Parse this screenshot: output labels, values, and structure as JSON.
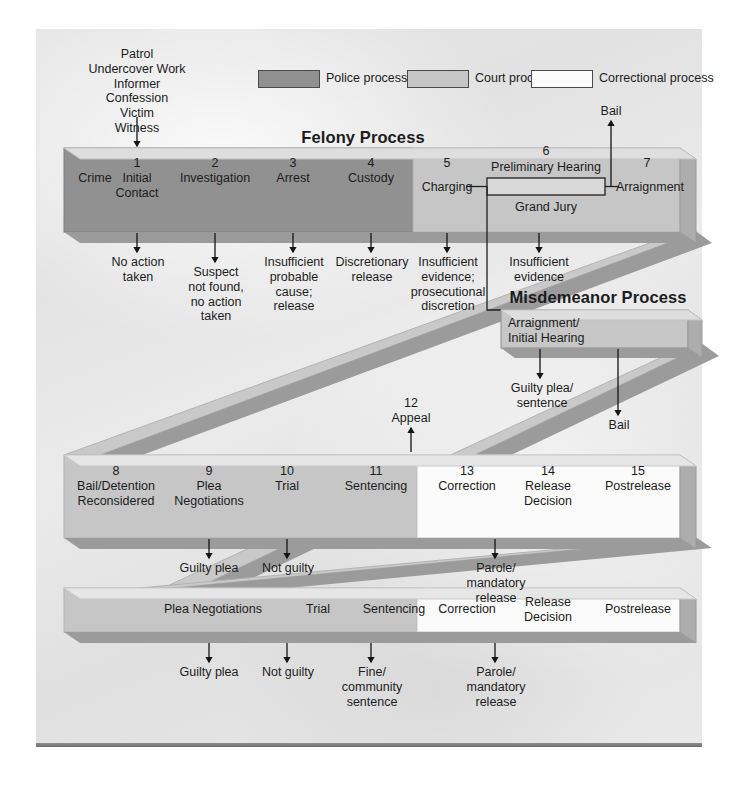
{
  "figure": {
    "title_felony": "Felony Process",
    "title_misdemeanor": "Misdemeanor Process"
  },
  "legend": {
    "items": [
      {
        "label": "Police process",
        "color": "#919191"
      },
      {
        "label": "Court process",
        "color": "#c6c6c6"
      },
      {
        "label": "Correctional process",
        "color": "#fbfbfb"
      }
    ]
  },
  "inputs": {
    "sources": "Patrol\nUndercover Work\nInformer\nConfession\nVictim\nWitness"
  },
  "felony_bar": {
    "steps": [
      {
        "num": "",
        "label": "Crime"
      },
      {
        "num": "1",
        "label": "Initial\nContact"
      },
      {
        "num": "2",
        "label": "Investigation"
      },
      {
        "num": "3",
        "label": "Arrest"
      },
      {
        "num": "4",
        "label": "Custody"
      },
      {
        "num": "5",
        "label": "Charging"
      },
      {
        "num": "6",
        "label": "Preliminary Hearing"
      },
      {
        "num": "7",
        "label": "Arraignment"
      }
    ],
    "grand_jury": "Grand Jury",
    "bail": "Bail"
  },
  "felony_exits": [
    {
      "label": "No action\ntaken"
    },
    {
      "label": "Suspect\nnot found,\nno action\ntaken"
    },
    {
      "label": "Insufficient\nprobable\ncause;\nrelease"
    },
    {
      "label": "Discretionary\nrelease"
    },
    {
      "label": "Insufficient\nevidence;\nprosecutional\ndiscretion"
    },
    {
      "label": "Insufficient\nevidence"
    }
  ],
  "misdemeanor": {
    "box_label": "Arraignment/\nInitial Hearing",
    "exits": [
      {
        "label": "Guilty plea/\nsentence"
      },
      {
        "label": "Bail"
      }
    ]
  },
  "middle_bar": {
    "steps": [
      {
        "num": "8",
        "label": "Bail/Detention\nReconsidered"
      },
      {
        "num": "9",
        "label": "Plea\nNegotiations"
      },
      {
        "num": "10",
        "label": "Trial"
      },
      {
        "num": "11",
        "label": "Sentencing"
      },
      {
        "num": "13",
        "label": "Correction"
      },
      {
        "num": "14",
        "label": "Release\nDecision"
      },
      {
        "num": "15",
        "label": "Postrelease"
      }
    ],
    "appeal": {
      "num": "12",
      "label": "Appeal"
    },
    "exits": [
      {
        "label": "Guilty plea"
      },
      {
        "label": "Not guilty"
      },
      {
        "label": "Parole/\nmandatory\nrelease"
      }
    ]
  },
  "bottom_bar": {
    "steps": [
      {
        "label": "Plea Negotiations"
      },
      {
        "label": "Trial"
      },
      {
        "label": "Sentencing"
      },
      {
        "label": "Correction"
      },
      {
        "label": "Release\nDecision"
      },
      {
        "label": "Postrelease"
      }
    ],
    "exits": [
      {
        "label": "Guilty plea"
      },
      {
        "label": "Not guilty"
      },
      {
        "label": "Fine/\ncommunity\nsentence"
      },
      {
        "label": "Parole/\nmandatory\nrelease"
      }
    ]
  }
}
